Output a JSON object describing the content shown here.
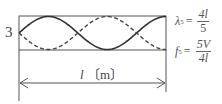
{
  "diagram": {
    "mode_number": "3",
    "length_label": "l",
    "length_unit": "〔m〕",
    "harmonic_loops": 1.25,
    "formulas": [
      {
        "symbol": "λ",
        "subscript": "5",
        "eq": "=",
        "numerator": "4l",
        "denominator": "5"
      },
      {
        "symbol": "f",
        "subscript": "5",
        "eq": "=",
        "numerator": "5V",
        "denominator": "4l"
      }
    ]
  }
}
